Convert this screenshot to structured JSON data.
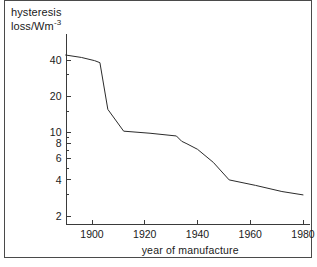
{
  "chart_data": {
    "type": "line",
    "title": "",
    "xlabel": "year of manufacture",
    "ylabel_lines": [
      "hysteresis",
      "loss/Wm"
    ],
    "ylabel_exponent": "-3",
    "ylabel_full": "hysteresis loss/Wm-3",
    "yscale": "log",
    "xscale": "linear",
    "grid": false,
    "legend": false,
    "xlim": [
      1890,
      1982
    ],
    "ylim": [
      2.6,
      52
    ],
    "xticks": [
      1900,
      1920,
      1940,
      1960,
      1980
    ],
    "xtick_labels": [
      "1900",
      "1920",
      "1940",
      "1960",
      "1980"
    ],
    "yticks": [
      40,
      20,
      10,
      8,
      6,
      4,
      2
    ],
    "ytick_labels": [
      "40",
      "20",
      "10",
      "8",
      "6",
      "4",
      "2"
    ],
    "series": [
      {
        "name": "hysteresis loss",
        "x": [
          1890,
          1896,
          1901,
          1903,
          1906,
          1912,
          1922,
          1932,
          1934,
          1936,
          1940,
          1946,
          1952,
          1962,
          1972,
          1980
        ],
        "values": [
          44.0,
          42.0,
          39.5,
          38.0,
          15.5,
          10.2,
          9.8,
          9.3,
          8.4,
          8.0,
          7.2,
          5.6,
          4.0,
          3.6,
          3.2,
          3.0
        ]
      }
    ]
  },
  "axes": {
    "x_axis_name": "year-of-manufacture-axis",
    "y_axis_name": "hysteresis-loss-axis"
  }
}
